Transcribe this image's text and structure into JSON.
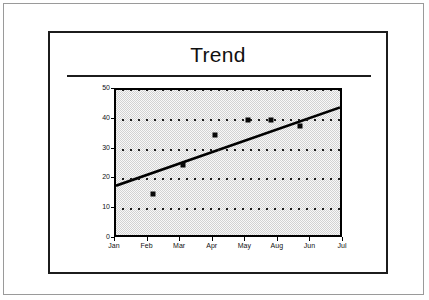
{
  "slide": {
    "title": "Trend"
  },
  "chart_data": {
    "type": "scatter",
    "title": "Trend",
    "xlabel": "",
    "ylabel": "",
    "categories": [
      "Jan",
      "Feb",
      "Mar",
      "Apr",
      "May",
      "Aug",
      "Jun",
      "Jul"
    ],
    "xticklabels": [
      "Jan",
      "Feb",
      "Mar",
      "Apr",
      "May",
      "Aug",
      "Jun",
      "Jul"
    ],
    "yticklabels": [
      "0",
      "10",
      "20",
      "30",
      "40",
      "50"
    ],
    "yticks": [
      0,
      10,
      20,
      30,
      40,
      50
    ],
    "ylim": [
      0,
      50
    ],
    "grid": true,
    "grid_axis": "y",
    "grid_style": "dotted",
    "legend": false,
    "plot_background": "#d2d2d2",
    "series": [
      {
        "name": "Observations",
        "type": "scatter",
        "marker": "square",
        "color": "#080808",
        "points": [
          {
            "x": 1.15,
            "y": 15
          },
          {
            "x": 2.05,
            "y": 25
          },
          {
            "x": 3.05,
            "y": 35
          },
          {
            "x": 4.05,
            "y": 40
          },
          {
            "x": 4.75,
            "y": 40
          },
          {
            "x": 5.65,
            "y": 38
          }
        ]
      },
      {
        "name": "Trend line",
        "type": "line",
        "color": "#000000",
        "x": [
          0,
          7
        ],
        "y": [
          17,
          44
        ]
      }
    ]
  }
}
